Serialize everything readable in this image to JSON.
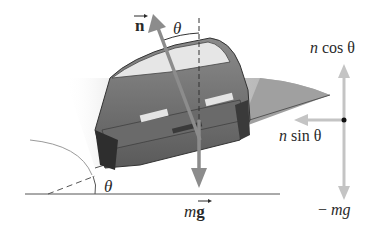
{
  "figure": {
    "type": "free-body diagram",
    "colors": {
      "background": "#ffffff",
      "road": "#9a9a9a",
      "car_body": "#6e6e6e",
      "vector": "#8c8c8c",
      "component_vector": "#c4c4c4",
      "text": "#2a2a2a"
    }
  },
  "labels": {
    "normal_vector": "n",
    "theta_top": "θ",
    "theta_bottom": "θ",
    "weight_m": "m",
    "weight_g": "g",
    "n_cos": "n cos θ",
    "n_cos_n": "n",
    "n_cos_rest": "cos θ",
    "n_sin_n": "n",
    "n_sin_rest": "sin θ",
    "neg_mg_minus": "−",
    "neg_mg_m": "mg"
  }
}
